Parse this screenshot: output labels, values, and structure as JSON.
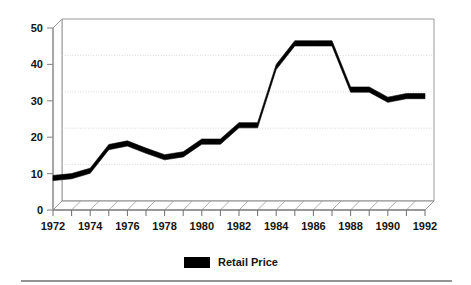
{
  "chart_data": {
    "type": "line",
    "title": "",
    "subtitle": "",
    "xlabel": "",
    "ylabel": "",
    "style": "3d-ribbon-line",
    "grid": true,
    "grid_axis": "y",
    "legend_position": "bottom-center",
    "xlim": [
      1972,
      1992
    ],
    "ylim": [
      0,
      50
    ],
    "yticks": [
      0,
      10,
      20,
      30,
      40,
      50
    ],
    "ytick_labels": [
      "0",
      "10",
      "20",
      "30",
      "40",
      "50"
    ],
    "xticks": [
      1972,
      1974,
      1976,
      1978,
      1980,
      1982,
      1984,
      1986,
      1988,
      1990,
      1992
    ],
    "xtick_labels": [
      "1972",
      "1974",
      "1976",
      "1978",
      "1980",
      "1982",
      "1984",
      "1986",
      "1988",
      "1990",
      "1992"
    ],
    "xtick_minor_every": 1,
    "x": [
      1972,
      1973,
      1974,
      1975,
      1976,
      1977,
      1978,
      1979,
      1980,
      1981,
      1982,
      1983,
      1984,
      1985,
      1986,
      1987,
      1988,
      1989,
      1990,
      1991,
      1992
    ],
    "series": [
      {
        "name": "Retail Price",
        "color": "#000000",
        "values": [
          9.5,
          10.0,
          11.5,
          18.0,
          19.0,
          17.0,
          15.2,
          16.0,
          19.5,
          19.5,
          24.0,
          24.0,
          40.0,
          46.5,
          46.5,
          46.5,
          33.8,
          33.8,
          31.0,
          32.0,
          32.0
        ]
      }
    ],
    "annotations": []
  },
  "legend": {
    "entries": [
      {
        "label": "Retail Price",
        "swatch_color": "#000000"
      }
    ]
  },
  "axes": {
    "y_axis_name": "value-axis",
    "x_axis_name": "year-axis"
  },
  "colors": {
    "series": "#000000",
    "grid": "#c9c9c9",
    "axis": "#8a8a8a",
    "wall": "#9a9a9a",
    "text": "#141414",
    "rule": "#2b2b2b",
    "background": "#ffffff"
  },
  "footer": {
    "rule_present": "true"
  }
}
